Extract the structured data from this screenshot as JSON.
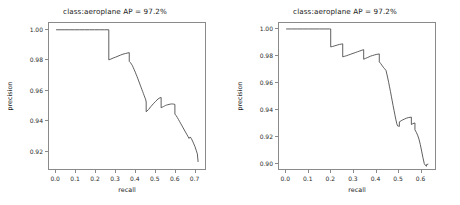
{
  "figure": {
    "background": "#ffffff",
    "panel_count": 2
  },
  "panels": [
    {
      "title": "class:aeroplane AP = 97.2%",
      "xlabel": "recall",
      "ylabel": "precision",
      "xticks": [
        "0.0",
        "0.1",
        "0.2",
        "0.3",
        "0.4",
        "0.5",
        "0.6",
        "0.7"
      ],
      "yticks": [
        "1.00",
        "0.98",
        "0.96",
        "0.94",
        "0.92"
      ]
    },
    {
      "title": "class:aeroplane AP = 97.2%",
      "xlabel": "recall",
      "ylabel": "precision",
      "xticks": [
        "0.0",
        "0.1",
        "0.2",
        "0.3",
        "0.4",
        "0.5",
        "0.6"
      ],
      "yticks": [
        "1.00",
        "0.98",
        "0.96",
        "0.94",
        "0.92",
        "0.90"
      ]
    }
  ],
  "chart_data": [
    {
      "type": "line",
      "title": "class:aeroplane AP = 97.2%",
      "xlabel": "recall",
      "ylabel": "precision",
      "xlim": [
        -0.036,
        0.757
      ],
      "ylim": [
        0.9075,
        1.0045
      ],
      "grid": false,
      "legend": null,
      "line_color": "#4d4d4d",
      "drawstyle": "steps-post",
      "annotations": [
        "AP = 97.2%"
      ],
      "x": [
        0.0,
        0.02,
        0.045,
        0.07,
        0.095,
        0.12,
        0.145,
        0.17,
        0.195,
        0.22,
        0.245,
        0.268,
        0.268,
        0.278,
        0.29,
        0.302,
        0.315,
        0.328,
        0.34,
        0.352,
        0.365,
        0.372,
        0.372,
        0.378,
        0.383,
        0.388,
        0.392,
        0.396,
        0.4,
        0.404,
        0.408,
        0.412,
        0.416,
        0.42,
        0.424,
        0.428,
        0.432,
        0.436,
        0.44,
        0.444,
        0.448,
        0.452,
        0.456,
        0.458,
        0.458,
        0.47,
        0.482,
        0.494,
        0.506,
        0.518,
        0.528,
        0.534,
        0.534,
        0.54,
        0.546,
        0.552,
        0.556,
        0.562,
        0.568,
        0.574,
        0.58,
        0.586,
        0.592,
        0.598,
        0.604,
        0.604,
        0.61,
        0.616,
        0.622,
        0.628,
        0.634,
        0.64,
        0.646,
        0.652,
        0.658,
        0.664,
        0.67,
        0.676,
        0.682,
        0.688,
        0.694,
        0.7,
        0.706,
        0.712,
        0.718,
        0.722
      ],
      "y": [
        1.0,
        1.0,
        1.0,
        1.0,
        1.0,
        1.0,
        1.0,
        1.0,
        1.0,
        1.0,
        1.0,
        1.0,
        0.98,
        0.9805,
        0.9812,
        0.9818,
        0.9825,
        0.9832,
        0.9838,
        0.9842,
        0.9846,
        0.9848,
        0.979,
        0.9782,
        0.9772,
        0.9762,
        0.975,
        0.9738,
        0.9726,
        0.9714,
        0.97,
        0.9688,
        0.9674,
        0.966,
        0.9646,
        0.9632,
        0.9618,
        0.9604,
        0.959,
        0.9576,
        0.9562,
        0.9548,
        0.9534,
        0.952,
        0.9455,
        0.947,
        0.949,
        0.9508,
        0.9524,
        0.954,
        0.9548,
        0.955,
        0.9482,
        0.9486,
        0.949,
        0.9494,
        0.9497,
        0.95,
        0.9502,
        0.9504,
        0.9506,
        0.9507,
        0.9507,
        0.9506,
        0.9504,
        0.944,
        0.943,
        0.9418,
        0.9404,
        0.939,
        0.9376,
        0.9362,
        0.9348,
        0.9334,
        0.932,
        0.9306,
        0.9292,
        0.9278,
        0.9288,
        0.9276,
        0.926,
        0.9242,
        0.9224,
        0.92,
        0.9176,
        0.9122
      ]
    },
    {
      "type": "line",
      "title": "class:aeroplane AP = 97.2%",
      "xlabel": "recall",
      "ylabel": "precision",
      "xlim": [
        -0.032,
        0.668
      ],
      "ylim": [
        0.8945,
        1.0045
      ],
      "grid": false,
      "legend": null,
      "line_color": "#4d4d4d",
      "drawstyle": "steps-post",
      "annotations": [
        "AP = 97.2%"
      ],
      "x": [
        0.0,
        0.025,
        0.05,
        0.075,
        0.1,
        0.125,
        0.15,
        0.175,
        0.195,
        0.2,
        0.2,
        0.208,
        0.216,
        0.224,
        0.232,
        0.24,
        0.248,
        0.254,
        0.254,
        0.262,
        0.27,
        0.28,
        0.29,
        0.3,
        0.31,
        0.32,
        0.33,
        0.34,
        0.348,
        0.348,
        0.356,
        0.364,
        0.372,
        0.38,
        0.388,
        0.396,
        0.404,
        0.412,
        0.418,
        0.418,
        0.424,
        0.43,
        0.436,
        0.442,
        0.448,
        0.452,
        0.456,
        0.46,
        0.464,
        0.468,
        0.472,
        0.476,
        0.48,
        0.484,
        0.488,
        0.492,
        0.496,
        0.5,
        0.504,
        0.508,
        0.508,
        0.516,
        0.524,
        0.532,
        0.54,
        0.548,
        0.556,
        0.562,
        0.562,
        0.568,
        0.574,
        0.578,
        0.578,
        0.584,
        0.59,
        0.596,
        0.602,
        0.608,
        0.614,
        0.62,
        0.626,
        0.63,
        0.63,
        0.638,
        0.644
      ],
      "y": [
        1.0,
        1.0,
        1.0,
        1.0,
        1.0,
        1.0,
        1.0,
        1.0,
        1.0,
        1.0,
        0.9865,
        0.9868,
        0.9872,
        0.9876,
        0.988,
        0.9884,
        0.9886,
        0.9888,
        0.979,
        0.9794,
        0.9798,
        0.9804,
        0.981,
        0.9816,
        0.9822,
        0.9828,
        0.9834,
        0.984,
        0.9844,
        0.9772,
        0.9778,
        0.9784,
        0.979,
        0.9796,
        0.98,
        0.9804,
        0.9808,
        0.981,
        0.9812,
        0.9752,
        0.974,
        0.9726,
        0.9712,
        0.97,
        0.9688,
        0.966,
        0.963,
        0.9598,
        0.9564,
        0.953,
        0.9494,
        0.9458,
        0.9422,
        0.9388,
        0.9354,
        0.932,
        0.929,
        0.927,
        0.9268,
        0.9266,
        0.93,
        0.9308,
        0.9316,
        0.9322,
        0.9328,
        0.9332,
        0.9334,
        0.9336,
        0.928,
        0.9286,
        0.929,
        0.9292,
        0.924,
        0.9222,
        0.92,
        0.917,
        0.913,
        0.908,
        0.903,
        0.8985,
        0.897,
        0.8966,
        0.8978,
        0.8982
      ]
    }
  ]
}
